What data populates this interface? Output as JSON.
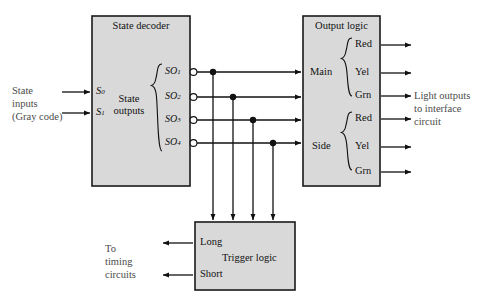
{
  "diagram": {
    "background_color": "#ffffff",
    "block_fill_color": "#d9d9d9",
    "line_color": "#111111"
  },
  "blocks": {
    "state_decoder": {
      "title": "State decoder",
      "inner_label_line1": "State",
      "inner_label_line2": "outputs",
      "inputs": [
        {
          "label": "S",
          "sub": "0"
        },
        {
          "label": "S",
          "sub": "1"
        }
      ],
      "outputs": [
        {
          "label": "SO",
          "sub": "1"
        },
        {
          "label": "SO",
          "sub": "2"
        },
        {
          "label": "SO",
          "sub": "3"
        },
        {
          "label": "SO",
          "sub": "4"
        }
      ]
    },
    "output_logic": {
      "title": "Output logic",
      "groups": [
        {
          "name": "Main",
          "lamps": [
            "Red",
            "Yel",
            "Grn"
          ]
        },
        {
          "name": "Side",
          "lamps": [
            "Red",
            "Yel",
            "Grn"
          ]
        }
      ]
    },
    "trigger_logic": {
      "title": "Trigger logic",
      "outputs": [
        "Long",
        "Short"
      ]
    }
  },
  "annotations": {
    "state_inputs": {
      "line1": "State",
      "line2": "inputs",
      "line3": "(Gray code)"
    },
    "light_outputs": {
      "line1": "Light outputs",
      "line2": "to interface",
      "line3": "circuit"
    },
    "timing_circuits": {
      "line1": "To",
      "line2": "timing",
      "line3": "circuits"
    }
  }
}
